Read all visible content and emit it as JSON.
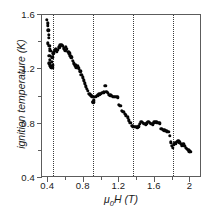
{
  "chart_data": {
    "type": "scatter",
    "title": "",
    "xlabel": "μ0H (T)",
    "xlabel_main": "H (T)",
    "xlabel_mu": "μ",
    "xlabel_sub": "0",
    "ylabel": "ignition temperature (K)",
    "xlim": [
      0.33,
      2.13
    ],
    "ylim": [
      0.4,
      1.6
    ],
    "grid": false,
    "legend": null,
    "xticks": [
      0.4,
      0.8,
      1.2,
      1.6,
      2
    ],
    "xtick_labels": [
      "0.4",
      "0.8",
      "1.2",
      "1.6",
      "2"
    ],
    "yticks": [
      0.4,
      0.8,
      1.2,
      1.6
    ],
    "ytick_labels": [
      "0.4",
      "0.8",
      "1.2",
      "1.6"
    ],
    "x_minor_ticks": [
      0.6,
      1.0,
      1.4,
      1.8
    ],
    "y_minor_ticks": [
      0.6,
      1.0,
      1.4
    ],
    "annotation_vlines": [
      0.45,
      0.9,
      1.35,
      1.8
    ],
    "marker_color": "#050505",
    "axis_color": "#5c5c5c",
    "vline_color": "#3a3a3a",
    "marker_size_px": 3.4,
    "points": [
      [
        0.385,
        1.565
      ],
      [
        0.392,
        1.54
      ],
      [
        0.398,
        1.52
      ],
      [
        0.4,
        1.487
      ],
      [
        0.404,
        1.455
      ],
      [
        0.408,
        1.43
      ],
      [
        0.396,
        1.392
      ],
      [
        0.412,
        1.375
      ],
      [
        0.418,
        1.352
      ],
      [
        0.424,
        1.338
      ],
      [
        0.414,
        1.3
      ],
      [
        0.42,
        1.272
      ],
      [
        0.41,
        1.245
      ],
      [
        0.418,
        1.228
      ],
      [
        0.428,
        1.222
      ],
      [
        0.436,
        1.216
      ],
      [
        0.444,
        1.212
      ],
      [
        0.452,
        1.23
      ],
      [
        0.44,
        1.255
      ],
      [
        0.448,
        1.29
      ],
      [
        0.456,
        1.318
      ],
      [
        0.464,
        1.33
      ],
      [
        0.474,
        1.34
      ],
      [
        0.486,
        1.348
      ],
      [
        0.498,
        1.332
      ],
      [
        0.51,
        1.345
      ],
      [
        0.524,
        1.362
      ],
      [
        0.538,
        1.376
      ],
      [
        0.552,
        1.382
      ],
      [
        0.566,
        1.372
      ],
      [
        0.578,
        1.356
      ],
      [
        0.59,
        1.34
      ],
      [
        0.6,
        1.368
      ],
      [
        0.612,
        1.352
      ],
      [
        0.624,
        1.33
      ],
      [
        0.636,
        1.318
      ],
      [
        0.648,
        1.3
      ],
      [
        0.66,
        1.288
      ],
      [
        0.676,
        1.262
      ],
      [
        0.69,
        1.244
      ],
      [
        0.704,
        1.23
      ],
      [
        0.718,
        1.216
      ],
      [
        0.732,
        1.222
      ],
      [
        0.746,
        1.208
      ],
      [
        0.76,
        1.186
      ],
      [
        0.772,
        1.162
      ],
      [
        0.786,
        1.14
      ],
      [
        0.8,
        1.118
      ],
      [
        0.812,
        1.096
      ],
      [
        0.824,
        1.074
      ],
      [
        0.836,
        1.058
      ],
      [
        0.848,
        1.04
      ],
      [
        0.86,
        1.022
      ],
      [
        0.872,
        1.012
      ],
      [
        0.884,
        1.004
      ],
      [
        0.896,
        0.996
      ],
      [
        0.9,
        0.962
      ],
      [
        0.908,
        0.958
      ],
      [
        0.916,
        0.972
      ],
      [
        0.928,
        0.996
      ],
      [
        0.944,
        1.004
      ],
      [
        0.96,
        1.01
      ],
      [
        0.976,
        1.016
      ],
      [
        0.992,
        1.022
      ],
      [
        1.008,
        1.026
      ],
      [
        1.024,
        1.03
      ],
      [
        1.04,
        1.078
      ],
      [
        1.052,
        1.034
      ],
      [
        1.068,
        1.026
      ],
      [
        1.084,
        1.014
      ],
      [
        1.1,
        1.008
      ],
      [
        1.116,
        1.004
      ],
      [
        1.132,
        1.0
      ],
      [
        1.148,
        0.998
      ],
      [
        1.164,
        0.996
      ],
      [
        1.18,
        0.994
      ],
      [
        1.196,
        0.938
      ],
      [
        1.212,
        0.93
      ],
      [
        1.228,
        0.896
      ],
      [
        1.244,
        0.886
      ],
      [
        1.26,
        0.874
      ],
      [
        1.276,
        0.862
      ],
      [
        1.292,
        0.846
      ],
      [
        1.308,
        0.826
      ],
      [
        1.324,
        0.806
      ],
      [
        1.338,
        0.786
      ],
      [
        1.352,
        0.782
      ],
      [
        1.368,
        0.778
      ],
      [
        1.384,
        0.776
      ],
      [
        1.4,
        0.774
      ],
      [
        1.416,
        0.782
      ],
      [
        1.432,
        0.798
      ],
      [
        1.448,
        0.812
      ],
      [
        1.464,
        0.808
      ],
      [
        1.48,
        0.8
      ],
      [
        1.496,
        0.796
      ],
      [
        1.512,
        0.804
      ],
      [
        1.528,
        0.812
      ],
      [
        1.544,
        0.806
      ],
      [
        1.56,
        0.8
      ],
      [
        1.576,
        0.796
      ],
      [
        1.592,
        0.81
      ],
      [
        1.608,
        0.812
      ],
      [
        1.624,
        0.81
      ],
      [
        1.64,
        0.808
      ],
      [
        1.656,
        0.802
      ],
      [
        1.672,
        0.762
      ],
      [
        1.688,
        0.756
      ],
      [
        1.704,
        0.752
      ],
      [
        1.72,
        0.748
      ],
      [
        1.736,
        0.744
      ],
      [
        1.752,
        0.74
      ],
      [
        1.768,
        0.712
      ],
      [
        1.782,
        0.664
      ],
      [
        1.792,
        0.638
      ],
      [
        1.8,
        0.622
      ],
      [
        1.812,
        0.648
      ],
      [
        1.824,
        0.66
      ],
      [
        1.836,
        0.656
      ],
      [
        1.848,
        0.668
      ],
      [
        1.862,
        0.672
      ],
      [
        1.876,
        0.664
      ],
      [
        1.89,
        0.65
      ],
      [
        1.904,
        0.642
      ],
      [
        1.918,
        0.65
      ],
      [
        1.932,
        0.636
      ],
      [
        1.946,
        0.622
      ],
      [
        1.96,
        0.614
      ],
      [
        1.974,
        0.606
      ],
      [
        1.988,
        0.598
      ],
      [
        2.0,
        0.594
      ]
    ]
  }
}
